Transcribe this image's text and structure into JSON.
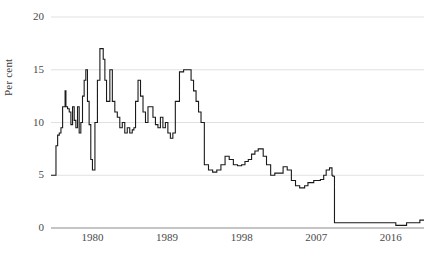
{
  "chart_data": {
    "type": "line",
    "title": "",
    "subtitle": "",
    "xlabel": "",
    "ylabel": "Per cent",
    "ylim": [
      0,
      20
    ],
    "xlim": [
      1975,
      2020
    ],
    "yticks": [
      0,
      5,
      10,
      15,
      20
    ],
    "ytick_labels": [
      "0",
      "5",
      "10",
      "15",
      "20"
    ],
    "xticks": [
      1980,
      1989,
      1998,
      2007,
      2016
    ],
    "xtick_labels": [
      "1980",
      "1989",
      "1998",
      "2007",
      "2016"
    ],
    "grid": "horizontal",
    "legend": "none",
    "line_color": "#1a1a1a",
    "grid_color": "#d9d9d9",
    "axis_color": "#8a8a8a",
    "series": [
      {
        "name": "Bank Rate",
        "x": [
          1975.0,
          1975.4,
          1975.6,
          1975.8,
          1976.0,
          1976.2,
          1976.4,
          1976.5,
          1976.7,
          1976.8,
          1977.0,
          1977.2,
          1977.4,
          1977.6,
          1977.8,
          1978.0,
          1978.2,
          1978.4,
          1978.6,
          1978.8,
          1979.0,
          1979.2,
          1979.4,
          1979.6,
          1979.8,
          1980.0,
          1980.3,
          1980.6,
          1980.9,
          1981.1,
          1981.3,
          1981.5,
          1981.7,
          1981.9,
          1982.1,
          1982.4,
          1982.7,
          1983.0,
          1983.3,
          1983.6,
          1983.9,
          1984.2,
          1984.5,
          1984.8,
          1985.0,
          1985.2,
          1985.5,
          1985.8,
          1986.1,
          1986.4,
          1986.7,
          1987.0,
          1987.3,
          1987.6,
          1987.9,
          1988.2,
          1988.5,
          1988.8,
          1989.1,
          1989.4,
          1989.7,
          1990.0,
          1990.5,
          1991.0,
          1991.3,
          1991.6,
          1991.9,
          1992.2,
          1992.5,
          1992.8,
          1993.1,
          1993.5,
          1994.0,
          1994.5,
          1995.0,
          1995.5,
          1996.0,
          1996.5,
          1997.0,
          1997.5,
          1998.0,
          1998.4,
          1998.8,
          1999.2,
          1999.6,
          2000.0,
          2000.6,
          2001.0,
          2001.5,
          2002.0,
          2003.0,
          2003.5,
          2004.0,
          2004.5,
          2005.0,
          2005.6,
          2006.0,
          2006.7,
          2007.0,
          2007.5,
          2007.9,
          2008.2,
          2008.6,
          2008.9,
          2009.0,
          2009.2,
          2010.0,
          2012.0,
          2014.0,
          2016.0,
          2016.6,
          2017.0,
          2017.9,
          2018.7,
          2019.5,
          2020.0
        ],
        "y": [
          5.0,
          5.0,
          7.8,
          8.8,
          9.0,
          9.5,
          11.5,
          11.5,
          13.0,
          11.5,
          11.3,
          11.0,
          9.8,
          11.5,
          10.2,
          9.5,
          11.5,
          9.0,
          10.0,
          12.5,
          14.0,
          15.0,
          12.0,
          9.8,
          6.5,
          5.5,
          10.0,
          14.0,
          17.0,
          17.0,
          16.0,
          14.0,
          12.0,
          12.0,
          15.0,
          12.0,
          11.0,
          10.5,
          9.5,
          10.0,
          9.0,
          9.5,
          9.0,
          9.3,
          9.5,
          12.0,
          14.0,
          12.5,
          11.0,
          10.0,
          11.5,
          11.5,
          10.5,
          9.8,
          9.5,
          10.5,
          9.5,
          10.0,
          9.0,
          8.5,
          9.0,
          12.0,
          14.8,
          15.0,
          15.0,
          15.0,
          14.0,
          13.0,
          12.0,
          11.0,
          10.0,
          6.0,
          5.5,
          5.3,
          5.5,
          6.0,
          6.8,
          6.5,
          6.0,
          5.9,
          6.0,
          6.3,
          6.5,
          7.0,
          7.3,
          7.5,
          6.8,
          6.0,
          5.0,
          5.2,
          5.8,
          5.5,
          4.5,
          4.0,
          3.8,
          4.0,
          4.3,
          4.5,
          4.5,
          4.6,
          5.0,
          5.5,
          5.7,
          5.0,
          4.9,
          0.5,
          0.5,
          0.5,
          0.5,
          0.5,
          0.25,
          0.25,
          0.5,
          0.5,
          0.75,
          0.75
        ]
      }
    ]
  }
}
